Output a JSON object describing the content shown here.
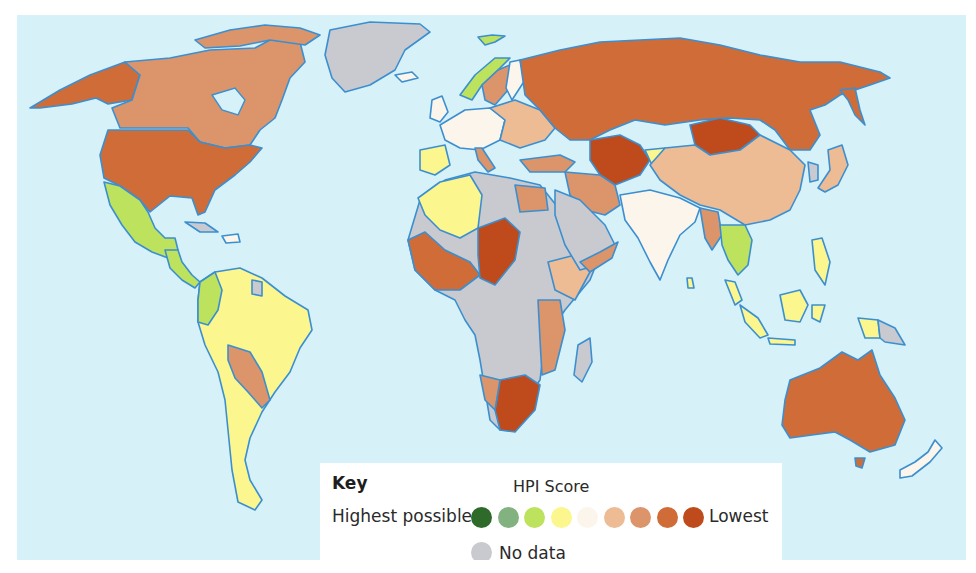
{
  "legend": {
    "key_title": "Key",
    "scale_title": "HPI Score",
    "high_label": "Highest possible",
    "low_label": "Lowest",
    "no_data_label": "No data",
    "scale": [
      {
        "level": 1,
        "color": "#2e6b2a"
      },
      {
        "level": 2,
        "color": "#82b27f"
      },
      {
        "level": 3,
        "color": "#bde25e"
      },
      {
        "level": 4,
        "color": "#fbf68e"
      },
      {
        "level": 5,
        "color": "#fbf5ec"
      },
      {
        "level": 6,
        "color": "#edbb94"
      },
      {
        "level": 7,
        "color": "#dc946a"
      },
      {
        "level": 8,
        "color": "#cf6c38"
      },
      {
        "level": 9,
        "color": "#bf4a1c"
      }
    ],
    "no_data_color": "#c8cacf"
  },
  "colors": {
    "ocean": "#d6f1f8",
    "coastline": "#3b8fd0"
  },
  "regions": [
    {
      "name": "Alaska (USA)",
      "level": 8
    },
    {
      "name": "Canada",
      "level": 7
    },
    {
      "name": "United States",
      "level": 8
    },
    {
      "name": "Mexico",
      "level": 3
    },
    {
      "name": "Central America",
      "level": 3
    },
    {
      "name": "Greenland",
      "level": "no_data"
    },
    {
      "name": "Colombia",
      "level": 3
    },
    {
      "name": "Brazil / South America",
      "level": 4
    },
    {
      "name": "Bolivia / Paraguay",
      "level": 7
    },
    {
      "name": "Norway",
      "level": 3
    },
    {
      "name": "Western Europe",
      "level": 5
    },
    {
      "name": "Iberia",
      "level": 4
    },
    {
      "name": "Eastern Europe",
      "level": 6
    },
    {
      "name": "Russia",
      "level": 8
    },
    {
      "name": "Mongolia",
      "level": 9
    },
    {
      "name": "China",
      "level": 6
    },
    {
      "name": "India",
      "level": 5
    },
    {
      "name": "Central Asia",
      "level": 9
    },
    {
      "name": "Middle East",
      "level": 7
    },
    {
      "name": "Arabian Peninsula",
      "level": "no_data"
    },
    {
      "name": "North Africa (Algeria/Morocco)",
      "level": 4
    },
    {
      "name": "Sahara / Central Africa",
      "level": "no_data"
    },
    {
      "name": "West Africa",
      "level": 8
    },
    {
      "name": "Chad / Central",
      "level": 9
    },
    {
      "name": "East Africa",
      "level": 6
    },
    {
      "name": "Southern Africa",
      "level": 9
    },
    {
      "name": "Southeast Asia",
      "level": 3
    },
    {
      "name": "Indonesia",
      "level": 4
    },
    {
      "name": "Papua New Guinea",
      "level": "no_data"
    },
    {
      "name": "Japan",
      "level": 6
    },
    {
      "name": "Australia",
      "level": 8
    },
    {
      "name": "New Zealand",
      "level": 5
    },
    {
      "name": "Madagascar",
      "level": "no_data"
    }
  ]
}
